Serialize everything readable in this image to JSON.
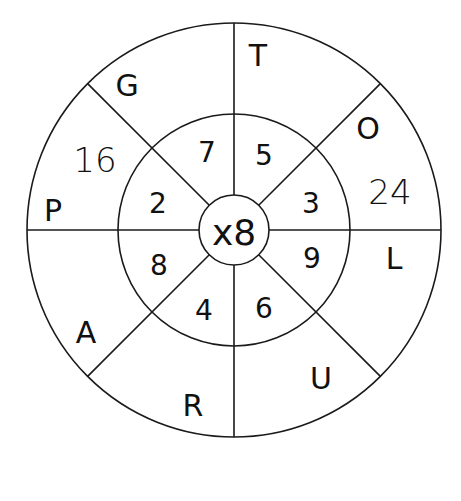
{
  "diagram": {
    "type": "multiplication-wheel",
    "center": {
      "label": "x8"
    },
    "inner_ring": [
      {
        "value": "7",
        "x": 207,
        "y": 152
      },
      {
        "value": "5",
        "x": 264,
        "y": 155
      },
      {
        "value": "3",
        "x": 311,
        "y": 203
      },
      {
        "value": "9",
        "x": 312,
        "y": 258
      },
      {
        "value": "6",
        "x": 264,
        "y": 308
      },
      {
        "value": "4",
        "x": 204,
        "y": 310
      },
      {
        "value": "8",
        "x": 159,
        "y": 265
      },
      {
        "value": "2",
        "x": 158,
        "y": 203
      }
    ],
    "outer_ring_letters": [
      {
        "value": "T",
        "x": 258,
        "y": 55
      },
      {
        "value": "O",
        "x": 368,
        "y": 128
      },
      {
        "value": "L",
        "x": 394,
        "y": 258
      },
      {
        "value": "U",
        "x": 321,
        "y": 378
      },
      {
        "value": "R",
        "x": 193,
        "y": 405
      },
      {
        "value": "A",
        "x": 86,
        "y": 332
      },
      {
        "value": "P",
        "x": 53,
        "y": 210
      },
      {
        "value": "G",
        "x": 127,
        "y": 85
      }
    ],
    "outer_ring_answers": [
      {
        "value": "16",
        "x": 95,
        "y": 160
      },
      {
        "value": "24",
        "x": 390,
        "y": 192
      }
    ],
    "colors": {
      "stroke": "#1a1a1a",
      "text": "#111111",
      "background": "#ffffff"
    }
  }
}
